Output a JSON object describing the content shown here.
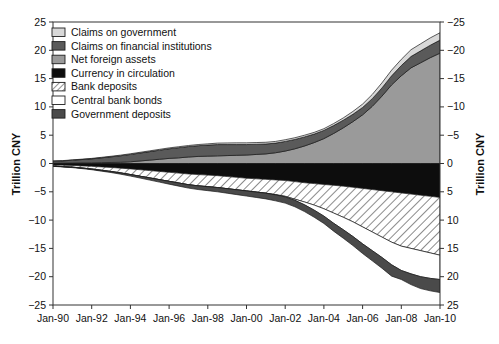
{
  "chart_data": {
    "type": "area",
    "title": "",
    "subtitle": "",
    "xlabel": "",
    "ylabel": "Trillion CNY",
    "ylabel_right": "Trillion CNY",
    "grid": false,
    "legend_position": "top-left",
    "ylim": [
      -25,
      25
    ],
    "yticks": [
      25,
      20,
      15,
      10,
      5,
      0,
      -5,
      -10,
      -15,
      -20,
      -25
    ],
    "yticks_right": [
      -25,
      -20,
      -15,
      -10,
      -5,
      0,
      5,
      10,
      15,
      20,
      25
    ],
    "right_axis_inverted": true,
    "xticks": [
      "Jan-90",
      "Jan-92",
      "Jan-94",
      "Jan-96",
      "Jan-98",
      "Jan-00",
      "Jan-02",
      "Jan-04",
      "Jan-06",
      "Jan-08",
      "Jan-10"
    ],
    "x": [
      1990.0,
      1990.5,
      1991.0,
      1991.5,
      1992.0,
      1992.5,
      1993.0,
      1993.5,
      1994.0,
      1994.5,
      1995.0,
      1995.5,
      1996.0,
      1996.5,
      1997.0,
      1997.5,
      1998.0,
      1998.5,
      1999.0,
      1999.5,
      2000.0,
      2000.5,
      2001.0,
      2001.5,
      2002.0,
      2002.5,
      2003.0,
      2003.5,
      2004.0,
      2004.5,
      2005.0,
      2005.5,
      2006.0,
      2006.5,
      2007.0,
      2007.5,
      2008.0,
      2008.5,
      2009.0,
      2009.5,
      2010.0
    ],
    "series": [
      {
        "name": "Net foreign assets",
        "sign": "positive",
        "stack_order": 1,
        "color": "#9a9a9a",
        "pattern": "solid",
        "values": [
          0.05,
          0.06,
          0.08,
          0.1,
          0.12,
          0.15,
          0.18,
          0.22,
          0.3,
          0.45,
          0.6,
          0.75,
          0.9,
          1.0,
          1.15,
          1.25,
          1.3,
          1.35,
          1.4,
          1.45,
          1.5,
          1.6,
          1.7,
          1.9,
          2.2,
          2.6,
          3.1,
          3.7,
          4.4,
          5.3,
          6.3,
          7.4,
          8.6,
          10.1,
          11.9,
          13.9,
          15.5,
          16.9,
          17.8,
          18.7,
          19.5
        ]
      },
      {
        "name": "Claims on financial institutions",
        "sign": "positive",
        "stack_order": 2,
        "color": "#5a5a5a",
        "pattern": "solid",
        "values": [
          0.35,
          0.4,
          0.5,
          0.6,
          0.7,
          0.85,
          1.0,
          1.15,
          1.3,
          1.4,
          1.5,
          1.6,
          1.7,
          1.8,
          1.85,
          1.9,
          1.95,
          2.0,
          1.95,
          1.9,
          1.85,
          1.8,
          1.75,
          1.7,
          1.7,
          1.65,
          1.6,
          1.5,
          1.45,
          1.4,
          1.35,
          1.3,
          1.3,
          1.35,
          1.45,
          1.6,
          1.8,
          2.0,
          2.1,
          2.2,
          2.3
        ]
      },
      {
        "name": "Claims on government",
        "sign": "positive",
        "stack_order": 3,
        "color": "#d8d8d8",
        "pattern": "solid",
        "values": [
          0.05,
          0.05,
          0.06,
          0.07,
          0.08,
          0.09,
          0.1,
          0.11,
          0.12,
          0.13,
          0.14,
          0.15,
          0.16,
          0.17,
          0.18,
          0.2,
          0.22,
          0.25,
          0.28,
          0.3,
          0.3,
          0.3,
          0.3,
          0.3,
          0.3,
          0.3,
          0.3,
          0.3,
          0.3,
          0.35,
          0.4,
          0.5,
          0.6,
          0.75,
          0.9,
          1.0,
          1.1,
          1.2,
          1.25,
          1.3,
          1.3
        ]
      },
      {
        "name": "Currency in circulation",
        "sign": "negative",
        "stack_order": 1,
        "color": "#0d0d0d",
        "pattern": "solid",
        "values": [
          0.25,
          0.3,
          0.35,
          0.42,
          0.5,
          0.6,
          0.7,
          0.82,
          0.95,
          1.1,
          1.25,
          1.4,
          1.55,
          1.7,
          1.85,
          1.95,
          2.05,
          2.15,
          2.3,
          2.45,
          2.6,
          2.7,
          2.8,
          2.9,
          3.0,
          3.2,
          3.4,
          3.55,
          3.7,
          3.85,
          4.0,
          4.2,
          4.4,
          4.6,
          4.8,
          5.0,
          5.2,
          5.4,
          5.6,
          5.8,
          6.0
        ]
      },
      {
        "name": "Bank deposits",
        "sign": "negative",
        "stack_order": 2,
        "color": "#ffffff",
        "pattern": "hatch",
        "values": [
          0.2,
          0.25,
          0.3,
          0.38,
          0.48,
          0.6,
          0.72,
          0.85,
          1.0,
          1.15,
          1.3,
          1.45,
          1.6,
          1.75,
          1.9,
          2.0,
          2.05,
          2.1,
          2.15,
          2.2,
          2.25,
          2.35,
          2.45,
          2.6,
          2.8,
          3.1,
          3.4,
          3.8,
          4.3,
          4.9,
          5.5,
          6.1,
          6.8,
          7.5,
          8.2,
          8.9,
          9.4,
          9.6,
          9.8,
          10.0,
          10.2
        ]
      },
      {
        "name": "Central bank bonds",
        "sign": "negative",
        "stack_order": 3,
        "color": "#ffffff",
        "pattern": "solid",
        "values": [
          0.0,
          0.0,
          0.0,
          0.0,
          0.0,
          0.0,
          0.0,
          0.0,
          0.0,
          0.0,
          0.0,
          0.0,
          0.0,
          0.0,
          0.0,
          0.0,
          0.0,
          0.0,
          0.0,
          0.0,
          0.0,
          0.0,
          0.0,
          0.05,
          0.1,
          0.2,
          0.5,
          0.9,
          1.3,
          1.8,
          2.2,
          2.6,
          3.0,
          3.3,
          3.6,
          4.0,
          4.3,
          4.5,
          4.6,
          4.5,
          4.3
        ]
      },
      {
        "name": "Government deposits",
        "sign": "negative",
        "stack_order": 4,
        "color": "#4a4a4a",
        "pattern": "solid",
        "values": [
          0.05,
          0.06,
          0.08,
          0.1,
          0.12,
          0.15,
          0.18,
          0.22,
          0.27,
          0.32,
          0.38,
          0.44,
          0.5,
          0.55,
          0.6,
          0.65,
          0.7,
          0.75,
          0.8,
          0.85,
          0.9,
          0.95,
          1.0,
          1.05,
          1.1,
          1.15,
          1.2,
          1.25,
          1.3,
          1.4,
          1.5,
          1.6,
          1.7,
          1.8,
          1.9,
          2.0,
          1.6,
          1.9,
          2.1,
          2.2,
          2.3
        ]
      }
    ],
    "legend": [
      {
        "label": "Claims on government",
        "color": "#d8d8d8",
        "pattern": "solid"
      },
      {
        "label": "Claims on financial institutions",
        "color": "#5a5a5a",
        "pattern": "solid"
      },
      {
        "label": "Net foreign assets",
        "color": "#9a9a9a",
        "pattern": "solid"
      },
      {
        "label": "Currency in circulation",
        "color": "#0d0d0d",
        "pattern": "solid"
      },
      {
        "label": "Bank deposits",
        "color": "#ffffff",
        "pattern": "hatch"
      },
      {
        "label": "Central bank bonds",
        "color": "#ffffff",
        "pattern": "solid"
      },
      {
        "label": "Government deposits",
        "color": "#4a4a4a",
        "pattern": "solid"
      }
    ]
  }
}
